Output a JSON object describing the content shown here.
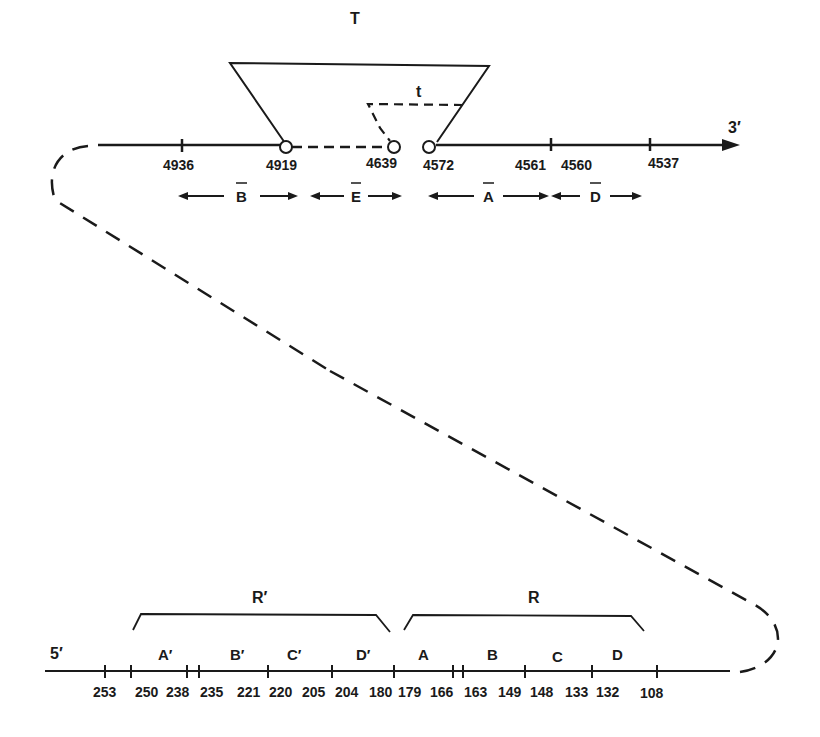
{
  "top_strand": {
    "end_label": "3′",
    "positions": [
      "4936",
      "4919",
      "4639",
      "4572",
      "4561",
      "4560",
      "4537"
    ],
    "segments": [
      {
        "label": "B",
        "overbar": true
      },
      {
        "label": "E",
        "overbar": true
      },
      {
        "label": "A",
        "overbar": true
      },
      {
        "label": "D",
        "overbar": true
      }
    ],
    "loop_T_label": "T",
    "loop_t_label": "t"
  },
  "bottom_strand": {
    "end_label": "5′",
    "positions": [
      "253",
      "250",
      "238",
      "235",
      "221",
      "220",
      "205",
      "204",
      "180",
      "179",
      "166",
      "163",
      "149",
      "148",
      "133",
      "132",
      "108"
    ],
    "segments": [
      {
        "label": "A′"
      },
      {
        "label": "B′"
      },
      {
        "label": "C′"
      },
      {
        "label": "D′"
      },
      {
        "label": "A"
      },
      {
        "label": "B"
      },
      {
        "label": "C"
      },
      {
        "label": "D"
      }
    ],
    "bracket_left_label": "R′",
    "bracket_right_label": "R"
  },
  "colors": {
    "ink": "#1a1a1a",
    "background": "#ffffff"
  }
}
